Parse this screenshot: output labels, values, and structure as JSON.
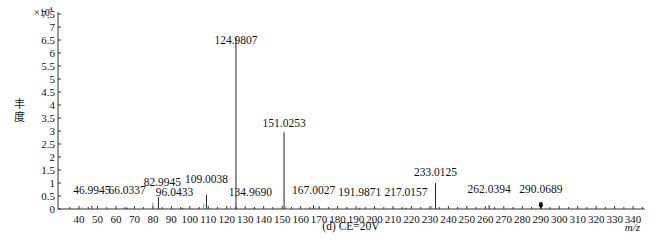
{
  "chart_data": {
    "type": "bar",
    "subtype": "mass-spectrum-stick",
    "title": "",
    "caption": "(d) CE=20V",
    "xlabel": "m/z",
    "ylabel": "丰度",
    "y_multiplier": "×10",
    "y_multiplier_exp": "4",
    "xlim": [
      30,
      345
    ],
    "ylim": [
      0,
      7.5
    ],
    "x_ticks": [
      40,
      50,
      60,
      70,
      80,
      90,
      100,
      110,
      120,
      130,
      140,
      150,
      160,
      170,
      180,
      190,
      200,
      210,
      220,
      230,
      240,
      250,
      260,
      270,
      280,
      290,
      300,
      310,
      320,
      330,
      340
    ],
    "y_ticks": [
      "0",
      "0.5",
      "1",
      "1.5",
      "2",
      "2.5",
      "3",
      "3.5",
      "4",
      "4.5",
      "5",
      "5.5",
      "6",
      "6.5",
      "7",
      "7.5"
    ],
    "grid": false,
    "legend": null,
    "labeled_peaks": [
      {
        "mz": 46.9945,
        "label": "46.9945",
        "intensity": 0.12
      },
      {
        "mz": 66.0337,
        "label": "66.0337",
        "intensity": 0.05
      },
      {
        "mz": 82.9945,
        "label": "82.9945",
        "intensity": 0.45
      },
      {
        "mz": 96.0433,
        "label": "96.0433",
        "intensity": 0.05
      },
      {
        "mz": 109.0038,
        "label": "109.0038",
        "intensity": 0.55
      },
      {
        "mz": 124.9807,
        "label": "124.9807",
        "intensity": 6.6
      },
      {
        "mz": 134.969,
        "label": "134.9690",
        "intensity": 0.05
      },
      {
        "mz": 151.0253,
        "label": "151.0253",
        "intensity": 2.95
      },
      {
        "mz": 167.0027,
        "label": "167.0027",
        "intensity": 0.15
      },
      {
        "mz": 191.9871,
        "label": "191.9871",
        "intensity": 0.05
      },
      {
        "mz": 217.0157,
        "label": "217.0157",
        "intensity": 0.05
      },
      {
        "mz": 233.0125,
        "label": "233.0125",
        "intensity": 1.0
      },
      {
        "mz": 262.0394,
        "label": "262.0394",
        "intensity": 0.15
      },
      {
        "mz": 290.0689,
        "label": "290.0689",
        "intensity": 0.12,
        "precursor_marker": true
      }
    ],
    "minor_peaks": [
      {
        "mz": 41.5,
        "intensity": 0.06
      },
      {
        "mz": 56.0,
        "intensity": 0.03
      },
      {
        "mz": 64.0,
        "intensity": 0.03
      },
      {
        "mz": 68.0,
        "intensity": 0.03
      },
      {
        "mz": 80.0,
        "intensity": 0.25
      },
      {
        "mz": 107.5,
        "intensity": 0.2
      },
      {
        "mz": 111.5,
        "intensity": 0.04
      },
      {
        "mz": 119.5,
        "intensity": 0.04
      },
      {
        "mz": 122.0,
        "intensity": 0.1
      },
      {
        "mz": 148.0,
        "intensity": 0.05
      },
      {
        "mz": 152.0,
        "intensity": 0.1
      },
      {
        "mz": 168.0,
        "intensity": 0.06
      },
      {
        "mz": 231.0,
        "intensity": 0.12
      }
    ]
  }
}
